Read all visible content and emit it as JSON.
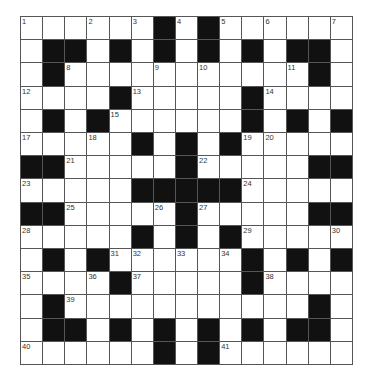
{
  "puzzle": {
    "rows": 15,
    "cols": 15,
    "colors": {
      "black": "#111111",
      "white": "#ffffff",
      "grid_line": "#555555"
    },
    "layout": [
      "...#.#.#.....",
      "placeholder"
    ],
    "grid": [
      "......#.#......",
      ".##.#.#.#.#.##.",
      ".#...........#.",
      "....#.....#....",
      ".#.#......#.#.#",
      ".....#.#.#.....",
      "##.....#.....##",
      ".....#####.....",
      "##.....#.....##",
      ".....#.#.#.....",
      ".#.#......#.#.#",
      "....#.....#....",
      ".#...........#.",
      ".##.#.#.#.#.##.",
      "......#.#......"
    ],
    "numbers": [
      {
        "n": "1",
        "r": 0,
        "c": 0
      },
      {
        "n": "2",
        "r": 0,
        "c": 3
      },
      {
        "n": "3",
        "r": 0,
        "c": 5
      },
      {
        "n": "4",
        "r": 0,
        "c": 7
      },
      {
        "n": "5",
        "r": 0,
        "c": 9
      },
      {
        "n": "6",
        "r": 0,
        "c": 11
      },
      {
        "n": "7",
        "r": 0,
        "c": 14
      },
      {
        "n": "8",
        "r": 2,
        "c": 2
      },
      {
        "n": "9",
        "r": 2,
        "c": 6
      },
      {
        "n": "10",
        "r": 2,
        "c": 8
      },
      {
        "n": "11",
        "r": 2,
        "c": 12
      },
      {
        "n": "12",
        "r": 3,
        "c": 0
      },
      {
        "n": "13",
        "r": 3,
        "c": 5
      },
      {
        "n": "14",
        "r": 3,
        "c": 11
      },
      {
        "n": "15",
        "r": 4,
        "c": 4
      },
      {
        "n": "16",
        "r": 4,
        "c": 10
      },
      {
        "n": "17",
        "r": 5,
        "c": 0
      },
      {
        "n": "18",
        "r": 5,
        "c": 3
      },
      {
        "n": "19",
        "r": 5,
        "c": 10
      },
      {
        "n": "20",
        "r": 5,
        "c": 11
      },
      {
        "n": "21",
        "r": 6,
        "c": 2
      },
      {
        "n": "22",
        "r": 6,
        "c": 8
      },
      {
        "n": "23",
        "r": 7,
        "c": 0
      },
      {
        "n": "24",
        "r": 7,
        "c": 10
      },
      {
        "n": "25",
        "r": 8,
        "c": 2
      },
      {
        "n": "26",
        "r": 8,
        "c": 6
      },
      {
        "n": "27",
        "r": 8,
        "c": 8
      },
      {
        "n": "28",
        "r": 9,
        "c": 0
      },
      {
        "n": "29",
        "r": 9,
        "c": 10
      },
      {
        "n": "30",
        "r": 9,
        "c": 14
      },
      {
        "n": "31",
        "r": 10,
        "c": 4
      },
      {
        "n": "32",
        "r": 10,
        "c": 5
      },
      {
        "n": "33",
        "r": 10,
        "c": 7
      },
      {
        "n": "34",
        "r": 10,
        "c": 9
      },
      {
        "n": "35",
        "r": 11,
        "c": 0
      },
      {
        "n": "36",
        "r": 11,
        "c": 3
      },
      {
        "n": "37",
        "r": 11,
        "c": 5
      },
      {
        "n": "38",
        "r": 11,
        "c": 11
      },
      {
        "n": "39",
        "r": 12,
        "c": 2
      },
      {
        "n": "40",
        "r": 14,
        "c": 0
      },
      {
        "n": "41",
        "r": 14,
        "c": 9
      }
    ]
  }
}
